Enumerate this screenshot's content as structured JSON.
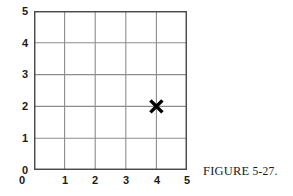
{
  "figure": {
    "caption_label": "FIGURE",
    "caption_number": "5-27."
  },
  "chart_data": {
    "type": "scatter",
    "title": "",
    "xlabel": "",
    "ylabel": "",
    "xlim": [
      0,
      5
    ],
    "ylim": [
      0,
      5
    ],
    "xticks": [
      "0",
      "1",
      "2",
      "3",
      "4",
      "5"
    ],
    "yticks": [
      "0",
      "1",
      "2",
      "3",
      "4",
      "5"
    ],
    "xtick_values": [
      0,
      1,
      2,
      3,
      4,
      5
    ],
    "ytick_values": [
      0,
      1,
      2,
      3,
      4,
      5
    ],
    "grid": true,
    "grid_step": 1,
    "legend": false,
    "legend_position": "none",
    "marker_style": "x",
    "marker_color": "#000000",
    "grid_color": "#8c8c8c",
    "border_color": "#4a4a4a",
    "background_color": "#ffffff",
    "points": [
      {
        "label": "X",
        "x": 4,
        "y": 2
      }
    ],
    "annotations": []
  }
}
